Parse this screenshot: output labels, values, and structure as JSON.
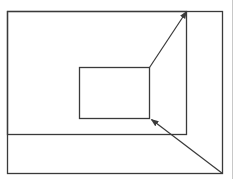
{
  "diagram": {
    "type": "nested-rectangles-with-arrows",
    "stroke_color": "#3a3a3a",
    "edge_line_color": "#c8c8c8",
    "background": "#ffffff",
    "shapes": [
      {
        "name": "outer-rect",
        "x": 7,
        "y": 11,
        "width": 215,
        "height": 162
      },
      {
        "name": "middle-rect",
        "x": 7,
        "y": 11,
        "width": 179,
        "height": 123
      },
      {
        "name": "inner-rect",
        "x": 79,
        "y": 67,
        "width": 70,
        "height": 51
      }
    ],
    "arrows": [
      {
        "name": "arrow-inner-top-right-to-middle-top-right",
        "from": [
          149,
          67
        ],
        "to": [
          186,
          11
        ]
      },
      {
        "name": "arrow-outer-bottom-right-to-inner-bottom-right",
        "from": [
          222,
          173
        ],
        "to": [
          151,
          119
        ]
      }
    ],
    "edge_line": {
      "x": 232,
      "y1": 0,
      "y2": 179
    }
  }
}
